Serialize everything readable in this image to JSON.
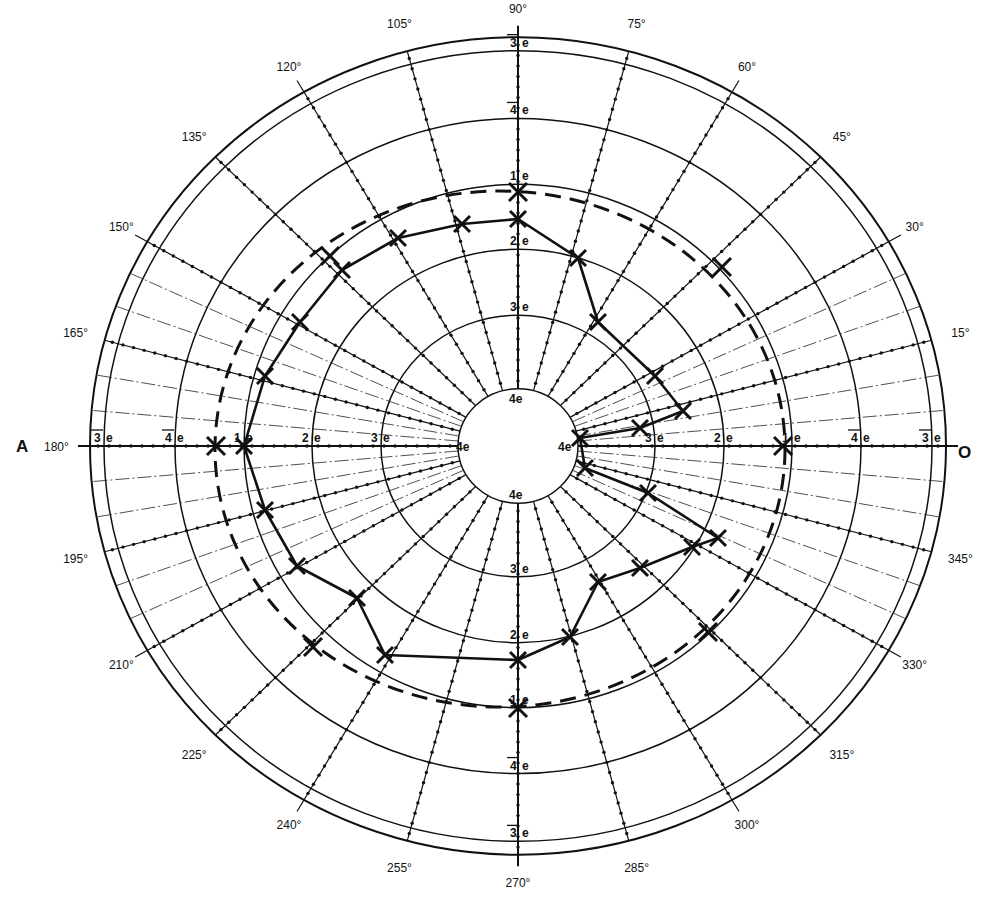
{
  "chart_data": {
    "type": "line",
    "subtype": "polar perimeter chart (visual field)",
    "title": "",
    "center_px": [
      518,
      446
    ],
    "y_scale": 0.955,
    "side_labels": {
      "left": "A",
      "right": "O"
    },
    "angle_labels": [
      {
        "deg": 0,
        "text": "0"
      },
      {
        "deg": 15,
        "text": "15°"
      },
      {
        "deg": 30,
        "text": "30°"
      },
      {
        "deg": 45,
        "text": "45°"
      },
      {
        "deg": 60,
        "text": "60°"
      },
      {
        "deg": 75,
        "text": "75°"
      },
      {
        "deg": 90,
        "text": "90°"
      },
      {
        "deg": 105,
        "text": "105°"
      },
      {
        "deg": 120,
        "text": "120°"
      },
      {
        "deg": 135,
        "text": "135°"
      },
      {
        "deg": 150,
        "text": "150°"
      },
      {
        "deg": 165,
        "text": "165°"
      },
      {
        "deg": 180,
        "text": "180°"
      },
      {
        "deg": 195,
        "text": "195°"
      },
      {
        "deg": 210,
        "text": "210°"
      },
      {
        "deg": 225,
        "text": "225°"
      },
      {
        "deg": 240,
        "text": "240°"
      },
      {
        "deg": 255,
        "text": "255°"
      },
      {
        "deg": 270,
        "text": "270°"
      },
      {
        "deg": 285,
        "text": "285°"
      },
      {
        "deg": 300,
        "text": "300°"
      },
      {
        "deg": 315,
        "text": "315°"
      },
      {
        "deg": 330,
        "text": "330°"
      },
      {
        "deg": 345,
        "text": "345°"
      }
    ],
    "rings": [
      {
        "r": 60,
        "label": "4e",
        "overbar": false
      },
      {
        "r": 137,
        "label": "3e",
        "overbar": false
      },
      {
        "r": 206,
        "label": "2e",
        "overbar": false
      },
      {
        "r": 274,
        "label": "1e",
        "overbar": false
      },
      {
        "r": 343,
        "label": "4e",
        "overbar": true
      },
      {
        "r": 414,
        "label": "3e",
        "overbar": true
      },
      {
        "r": 428,
        "label": "",
        "overbar": false
      }
    ],
    "series": [
      {
        "name": "measured isopter (solid)",
        "style": "solid",
        "points_px": [
          [
            518,
            219
          ],
          [
            578,
            258
          ],
          [
            598,
            322
          ],
          [
            655,
            376
          ],
          [
            683,
            411
          ],
          [
            640,
            428
          ],
          [
            580,
            438
          ],
          [
            585,
            468
          ],
          [
            648,
            493
          ],
          [
            718,
            538
          ],
          [
            692,
            547
          ],
          [
            640,
            568
          ],
          [
            598,
            582
          ],
          [
            570,
            637
          ],
          [
            518,
            660
          ],
          [
            385,
            655
          ],
          [
            357,
            598
          ],
          [
            297,
            566
          ],
          [
            265,
            510
          ],
          [
            244,
            446
          ],
          [
            265,
            376
          ],
          [
            300,
            322
          ],
          [
            342,
            270
          ],
          [
            398,
            238
          ],
          [
            462,
            224
          ],
          [
            518,
            219
          ]
        ]
      },
      {
        "name": "reference isopter (dashed)",
        "style": "dashed",
        "ellipse_px": {
          "cx": 500,
          "cy": 449,
          "rx": 285,
          "ry": 258
        },
        "markers_px": [
          [
            518,
            192
          ],
          [
            216,
            446
          ],
          [
            783,
            446
          ],
          [
            518,
            708
          ],
          [
            330,
            256
          ],
          [
            722,
            267
          ],
          [
            313,
            647
          ],
          [
            708,
            632
          ]
        ]
      }
    ]
  }
}
